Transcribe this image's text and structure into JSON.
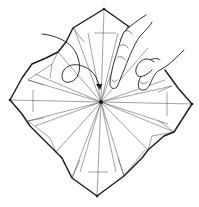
{
  "diagram": {
    "type": "origami-fold-instruction",
    "caption": "",
    "colors": {
      "background": "#ffffff",
      "outline": "#1a1a1a",
      "crease": "#555555"
    },
    "vertices": {
      "center": [
        101,
        102
      ],
      "top": [
        104,
        9
      ],
      "right": [
        192,
        104
      ],
      "bottom": [
        97,
        196
      ],
      "left": [
        10,
        100
      ]
    },
    "elements": [
      {
        "name": "paper-outline",
        "kind": "thick-line"
      },
      {
        "name": "crease-lines",
        "kind": "thin-lines",
        "count_radial": 16
      },
      {
        "name": "hand",
        "kind": "illustration",
        "position": "upper-right"
      },
      {
        "name": "push-arrow",
        "kind": "curved-arrow-with-loop",
        "points_to": "center"
      }
    ]
  }
}
